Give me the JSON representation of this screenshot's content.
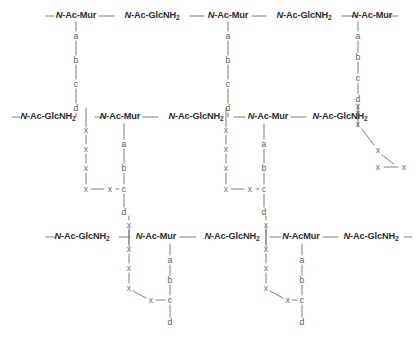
{
  "figure": {
    "background_color": "#ffffff",
    "backbone_color": "#2e2e33",
    "residue_color": "#6c6c74",
    "bond_color": "#8e8e96"
  },
  "sugars": {
    "mur": "N-Ac-Mur",
    "glcnh2_pre": "N-Ac-GlcNH",
    "glcnh2_sub": "2",
    "mur_alt": "N-AcMur",
    "italic_prefix": "N"
  },
  "residues": {
    "a": "a",
    "b": "b",
    "c": "c",
    "d": "d",
    "x": "x"
  },
  "rows": {
    "top": {
      "name": "glycan-strand-top",
      "units": [
        {
          "id": "t1",
          "label": "N-Ac-Mur",
          "type": "mur",
          "x": 76,
          "y": 16
        },
        {
          "id": "t2",
          "label": "N-Ac-GlcNH2",
          "type": "glc",
          "x": 152,
          "y": 16
        },
        {
          "id": "t3",
          "label": "N-Ac-Mur",
          "type": "mur",
          "x": 228,
          "y": 16
        },
        {
          "id": "t4",
          "label": "N-Ac-GlcNH2",
          "type": "glc",
          "x": 304,
          "y": 16
        },
        {
          "id": "t5",
          "label": "N-Ac-Mur",
          "type": "mur",
          "x": 372,
          "y": 16
        }
      ]
    },
    "middle": {
      "name": "glycan-strand-middle",
      "units": [
        {
          "id": "m1",
          "label": "N-Ac-GlcNH2",
          "type": "glc",
          "x": 48,
          "y": 117
        },
        {
          "id": "m2",
          "label": "N-Ac-Mur",
          "type": "mur",
          "x": 120,
          "y": 117
        },
        {
          "id": "m3",
          "label": "N-Ac-GlcNH2",
          "type": "glc",
          "x": 196,
          "y": 117
        },
        {
          "id": "m4",
          "label": "N-Ac-Mur",
          "type": "mur",
          "x": 268,
          "y": 117
        },
        {
          "id": "m5",
          "label": "N-Ac-GlcNH2",
          "type": "glc",
          "x": 340,
          "y": 117
        }
      ]
    },
    "bottom": {
      "name": "glycan-strand-bottom",
      "units": [
        {
          "id": "b1",
          "label": "N-Ac-GlcNH2",
          "type": "glc",
          "x": 82,
          "y": 237
        },
        {
          "id": "b2",
          "label": "N-Ac-Mur",
          "type": "mur",
          "x": 156,
          "y": 237
        },
        {
          "id": "b3",
          "label": "N-Ac-GlcNH2",
          "type": "glc",
          "x": 232,
          "y": 237
        },
        {
          "id": "b4",
          "label": "N-AcMur",
          "type": "muralt",
          "x": 301,
          "y": 237
        },
        {
          "id": "b5",
          "label": "N-Ac-GlcNH2",
          "type": "glc",
          "x": 371,
          "y": 237
        }
      ]
    }
  },
  "peptide_stems": [
    {
      "name": "stem-top-left",
      "letters": [
        "a",
        "b",
        "c",
        "d"
      ],
      "x": 76,
      "ys": [
        36,
        60,
        84,
        108
      ]
    },
    {
      "name": "stem-top-mid",
      "letters": [
        "a",
        "b",
        "c",
        "d"
      ],
      "x": 228,
      "ys": [
        36,
        60,
        84,
        108
      ]
    },
    {
      "name": "stem-top-right",
      "letters": [
        "a",
        "b",
        "c",
        "d",
        "x"
      ],
      "x": 358,
      "ys": [
        36,
        57,
        78,
        99,
        113
      ]
    },
    {
      "name": "bridge-mid-left",
      "letters": [
        "x",
        "x",
        "x",
        "x"
      ],
      "x": 86,
      "ys": [
        130,
        149,
        168,
        189
      ]
    },
    {
      "name": "stem-mid-left",
      "letters": [
        "a",
        "b",
        "c",
        "d"
      ],
      "x": 124,
      "ys": [
        144,
        168,
        189,
        212
      ]
    },
    {
      "name": "bridge-mid-ctr",
      "letters": [
        "x",
        "x",
        "x",
        "x"
      ],
      "x": 226,
      "ys": [
        130,
        149,
        168,
        189
      ]
    },
    {
      "name": "stem-mid-ctr",
      "letters": [
        "a",
        "b",
        "c",
        "d"
      ],
      "x": 264,
      "ys": [
        144,
        168,
        189,
        212
      ]
    },
    {
      "name": "bridge-mid-right",
      "letters": [
        "x",
        "x"
      ],
      "x": 358,
      "ys": [
        106,
        124
      ]
    },
    {
      "name": "bridge-bot-left",
      "letters": [
        "x",
        "x",
        "x",
        "x"
      ],
      "x": 129,
      "ys": [
        225,
        249,
        268,
        288
      ]
    },
    {
      "name": "stem-bot-left",
      "letters": [
        "a",
        "b",
        "c",
        "d"
      ],
      "x": 170,
      "ys": [
        260,
        280,
        300,
        322
      ]
    },
    {
      "name": "bridge-bot-right",
      "letters": [
        "x",
        "x",
        "x",
        "x"
      ],
      "x": 266,
      "ys": [
        225,
        249,
        268,
        288
      ]
    },
    {
      "name": "stem-bot-right",
      "letters": [
        "a",
        "b",
        "c",
        "d"
      ],
      "x": 302,
      "ys": [
        260,
        280,
        300,
        322
      ]
    }
  ],
  "cross_links": [
    {
      "name": "crosslink-mid-left",
      "points": "86,189 110,189 124,189"
    },
    {
      "name": "crosslink-mid-ctr",
      "points": "226,189 250,189 264,189"
    },
    {
      "name": "crosslink-bot-left",
      "points": "129,288 150,300 170,300"
    },
    {
      "name": "crosslink-bot-right",
      "points": "266,288 288,300 302,300"
    },
    {
      "name": "crosslink-right-tail",
      "points": "358,124 378,146 396,163"
    }
  ],
  "tail_residues": [
    {
      "name": "tail-x-1",
      "letter": "x",
      "x": 378,
      "y": 150
    },
    {
      "name": "tail-x-2",
      "letter": "x",
      "x": 378,
      "y": 167
    },
    {
      "name": "tail-x-3",
      "letter": "x",
      "x": 404,
      "y": 167
    }
  ]
}
